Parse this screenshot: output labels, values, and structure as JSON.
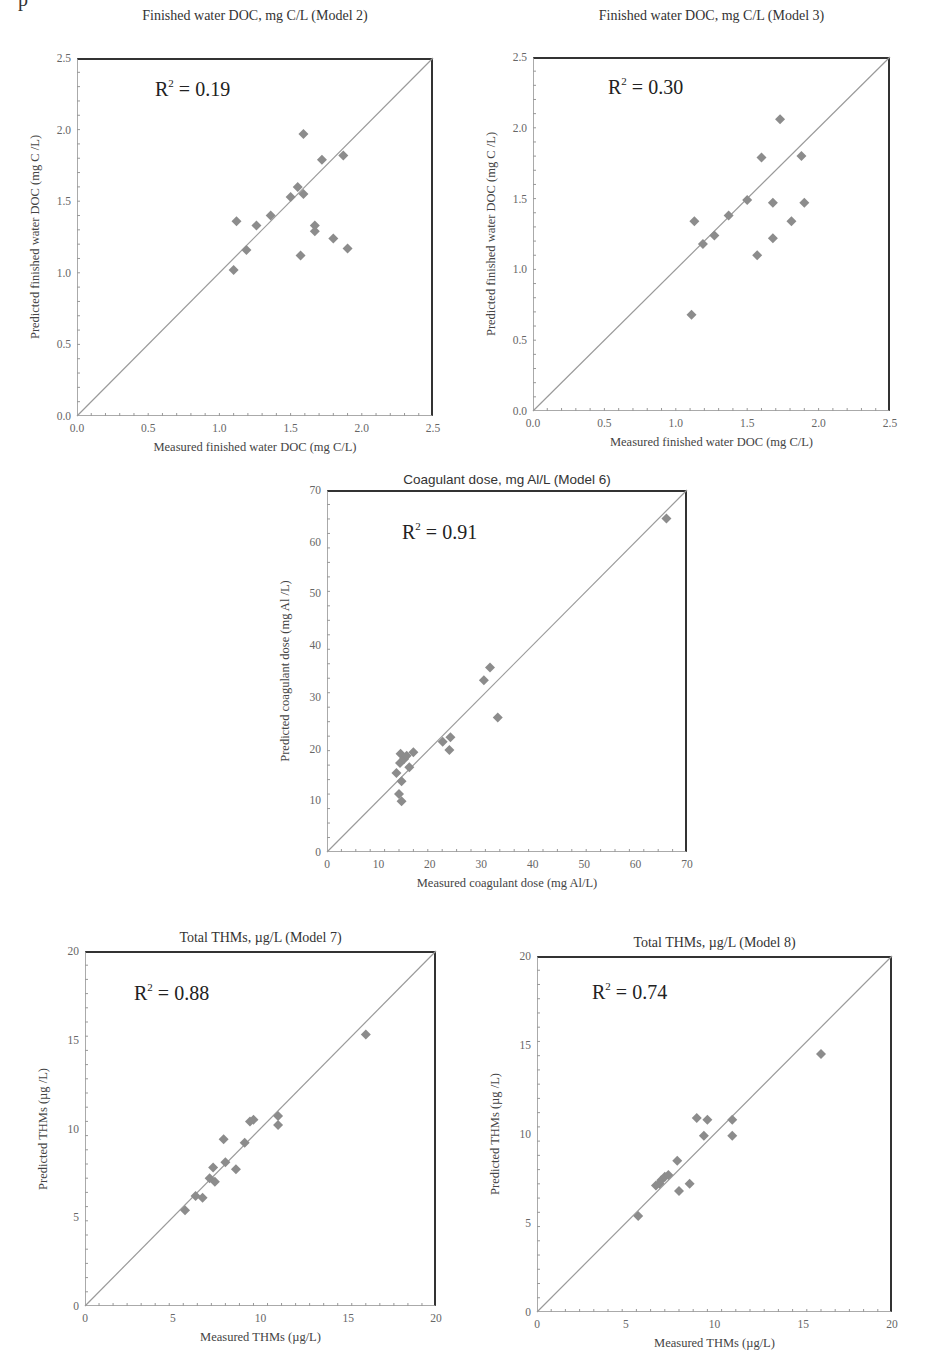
{
  "page_marker": "p",
  "chart_data": [
    {
      "type": "scatter",
      "title": "Finished water DOC, mg C/L (Model 2)",
      "annotation": "R2 = 0.19",
      "r2_value": "0.19",
      "xlabel": "Measured finished water DOC  (mg C/L)",
      "ylabel": "Predicted  finished water DOC  (mg C /L)",
      "xlim": [
        0,
        2.5
      ],
      "ylim": [
        0,
        2.5
      ],
      "xticks": [
        "0.0",
        "0.5",
        "1.0",
        "1.5",
        "2.0",
        "2.5"
      ],
      "yticks": [
        "0.0",
        "0.5",
        "1.0",
        "1.5",
        "2.0",
        "2.5"
      ],
      "reference_line": "1:1",
      "grid": false,
      "marker": "diamond",
      "marker_color": "#8c8c8c",
      "points": [
        [
          1.1,
          1.02
        ],
        [
          1.12,
          1.36
        ],
        [
          1.19,
          1.16
        ],
        [
          1.26,
          1.33
        ],
        [
          1.36,
          1.4
        ],
        [
          1.5,
          1.53
        ],
        [
          1.55,
          1.6
        ],
        [
          1.59,
          1.55
        ],
        [
          1.59,
          1.97
        ],
        [
          1.57,
          1.12
        ],
        [
          1.67,
          1.33
        ],
        [
          1.67,
          1.29
        ],
        [
          1.72,
          1.79
        ],
        [
          1.8,
          1.24
        ],
        [
          1.87,
          1.82
        ],
        [
          1.9,
          1.17
        ]
      ]
    },
    {
      "type": "scatter",
      "title": "Finished water DOC, mg C/L (Model 3)",
      "annotation": "R2 = 0.30",
      "r2_value": "0.30",
      "xlabel": "Measured finished water DOC  (mg C/L)",
      "ylabel": "Predicted  finished water DOC  (mg C /L)",
      "xlim": [
        0,
        2.5
      ],
      "ylim": [
        0,
        2.5
      ],
      "xticks": [
        "0.0",
        "0.5",
        "1.0",
        "1.5",
        "2.0",
        "2.5"
      ],
      "yticks": [
        "0.0",
        "0.5",
        "1.0",
        "1.5",
        "2.0",
        "2.5"
      ],
      "reference_line": "1:1",
      "grid": false,
      "marker": "diamond",
      "marker_color": "#8c8c8c",
      "points": [
        [
          1.11,
          0.68
        ],
        [
          1.13,
          1.34
        ],
        [
          1.19,
          1.18
        ],
        [
          1.27,
          1.24
        ],
        [
          1.37,
          1.38
        ],
        [
          1.5,
          1.49
        ],
        [
          1.57,
          1.1
        ],
        [
          1.6,
          1.79
        ],
        [
          1.68,
          1.47
        ],
        [
          1.68,
          1.22
        ],
        [
          1.73,
          2.06
        ],
        [
          1.81,
          1.34
        ],
        [
          1.88,
          1.8
        ],
        [
          1.9,
          1.47
        ]
      ]
    },
    {
      "type": "scatter",
      "title": "Coagulant dose, mg Al/L (Model 6)",
      "annotation": "R2 = 0.91",
      "r2_value": "0.91",
      "xlabel": "Measured coagulant dose (mg Al/L)",
      "ylabel": "Predicted coagulant dose (mg Al /L)",
      "xlim": [
        0,
        70
      ],
      "ylim": [
        0,
        70
      ],
      "xticks": [
        "0",
        "10",
        "20",
        "30",
        "40",
        "50",
        "60",
        "70"
      ],
      "yticks": [
        "0",
        "10",
        "20",
        "30",
        "40",
        "50",
        "60",
        "70"
      ],
      "reference_line": "1:1",
      "grid": false,
      "marker": "diamond",
      "marker_color": "#8c8c8c",
      "points": [
        [
          13.5,
          15.3
        ],
        [
          14.0,
          11.2
        ],
        [
          14.2,
          17.2
        ],
        [
          14.3,
          19.0
        ],
        [
          14.5,
          13.7
        ],
        [
          14.5,
          9.8
        ],
        [
          15.0,
          18.0
        ],
        [
          15.5,
          18.6
        ],
        [
          16.0,
          16.4
        ],
        [
          16.8,
          19.3
        ],
        [
          22.5,
          21.3
        ],
        [
          23.8,
          19.7
        ],
        [
          24.0,
          22.2
        ],
        [
          30.5,
          33.2
        ],
        [
          31.7,
          35.7
        ],
        [
          33.2,
          26.0
        ],
        [
          66.0,
          64.5
        ]
      ]
    },
    {
      "type": "scatter",
      "title": "Total THMs, µg/L (Model 7)",
      "annotation": "R2 = 0.88",
      "r2_value": "0.88",
      "xlabel": "Measured THMs (µg/L)",
      "ylabel": "Predicted  THMs  (µg /L)",
      "xlim": [
        0,
        20
      ],
      "ylim": [
        0,
        20
      ],
      "xticks": [
        "0",
        "5",
        "10",
        "15",
        "20"
      ],
      "yticks": [
        "0",
        "5",
        "10",
        "15",
        "20"
      ],
      "reference_line": "1:1",
      "grid": false,
      "marker": "diamond",
      "marker_color": "#8c8c8c",
      "points": [
        [
          5.7,
          5.4
        ],
        [
          6.3,
          6.2
        ],
        [
          6.7,
          6.1
        ],
        [
          7.1,
          7.2
        ],
        [
          7.3,
          7.8
        ],
        [
          7.4,
          7.0
        ],
        [
          7.9,
          9.4
        ],
        [
          8.0,
          8.1
        ],
        [
          8.6,
          7.7
        ],
        [
          9.1,
          9.2
        ],
        [
          9.4,
          10.4
        ],
        [
          9.6,
          10.5
        ],
        [
          11.0,
          10.2
        ],
        [
          11.0,
          10.7
        ],
        [
          16.0,
          15.3
        ]
      ]
    },
    {
      "type": "scatter",
      "title": "Total THMs, µg/L (Model 8)",
      "annotation": "R2 = 0.74",
      "r2_value": "0.74",
      "xlabel": "Measured THMs (µg/L)",
      "ylabel": "Predicted  THMs  (µg /L)",
      "xlim": [
        0,
        20
      ],
      "ylim": [
        0,
        20
      ],
      "xticks": [
        "0",
        "5",
        "10",
        "15",
        "20"
      ],
      "yticks": [
        "0",
        "5",
        "10",
        "15",
        "20"
      ],
      "reference_line": "1:1",
      "grid": false,
      "marker": "diamond",
      "marker_color": "#8c8c8c",
      "points": [
        [
          5.7,
          5.4
        ],
        [
          6.7,
          7.1
        ],
        [
          6.9,
          7.2
        ],
        [
          7.0,
          7.4
        ],
        [
          7.2,
          7.6
        ],
        [
          7.4,
          7.7
        ],
        [
          7.9,
          8.5
        ],
        [
          8.0,
          6.8
        ],
        [
          8.6,
          7.2
        ],
        [
          9.0,
          10.9
        ],
        [
          9.4,
          9.9
        ],
        [
          9.6,
          10.8
        ],
        [
          11.0,
          10.8
        ],
        [
          11.0,
          9.9
        ],
        [
          16.0,
          14.5
        ]
      ]
    }
  ],
  "layout": [
    {
      "left": 77,
      "top": 58,
      "right": 433,
      "bottom": 416,
      "title_y": 8,
      "title_sans": false,
      "r2_x": 155,
      "r2_y": 77
    },
    {
      "left": 533,
      "top": 57,
      "right": 890,
      "bottom": 411,
      "title_y": 8,
      "title_sans": false,
      "r2_x": 608,
      "r2_y": 75
    },
    {
      "left": 327,
      "top": 490,
      "right": 687,
      "bottom": 852,
      "title_y": 472,
      "title_sans": true,
      "r2_x": 402,
      "r2_y": 520
    },
    {
      "left": 85,
      "top": 951,
      "right": 436,
      "bottom": 1306,
      "title_y": 930,
      "title_sans": false,
      "r2_x": 134,
      "r2_y": 981
    },
    {
      "left": 537,
      "top": 956,
      "right": 892,
      "bottom": 1312,
      "title_y": 935,
      "title_sans": false,
      "r2_x": 592,
      "r2_y": 980
    }
  ]
}
